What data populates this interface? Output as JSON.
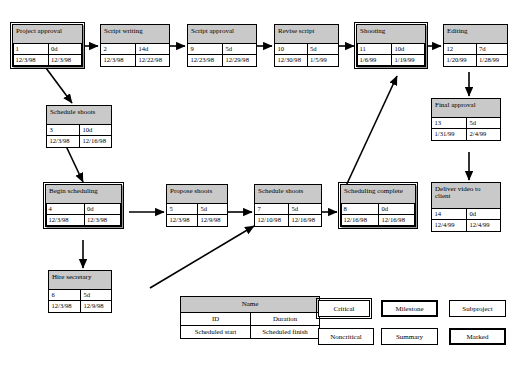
{
  "diagram": {
    "type": "project-network-diagram",
    "colors": {
      "node_header_fill": "#c9c9c9",
      "node_body_fill": "#ffffff",
      "border": "#000000",
      "page_background": "#ffffff"
    },
    "nodes": [
      {
        "key": "project_approval",
        "name": "Project approval",
        "id": "1",
        "duration": "0d",
        "start": "12/3/98",
        "finish": "12/3/98",
        "style": "milestone"
      },
      {
        "key": "script_writing",
        "name": "Script writing",
        "id": "2",
        "duration": "14d",
        "start": "12/3/98",
        "finish": "12/22/98",
        "style": "critical"
      },
      {
        "key": "script_approval",
        "name": "Script approval",
        "id": "9",
        "duration": "5d",
        "start": "12/23/98",
        "finish": "12/29/98",
        "style": "critical"
      },
      {
        "key": "revise_script",
        "name": "Revise script",
        "id": "10",
        "duration": "5d",
        "start": "12/30/98",
        "finish": "1/5/99",
        "style": "critical"
      },
      {
        "key": "shooting",
        "name": "Shooting",
        "id": "11",
        "duration": "10d",
        "start": "1/6/99",
        "finish": "1/19/99",
        "style": "marked"
      },
      {
        "key": "editing",
        "name": "Editing",
        "id": "12",
        "duration": "7d",
        "start": "1/20/99",
        "finish": "1/28/99",
        "style": "critical"
      },
      {
        "key": "final_approval",
        "name": "Final approval",
        "id": "13",
        "duration": "5d",
        "start": "1/31/99",
        "finish": "2/4/99",
        "style": "critical"
      },
      {
        "key": "deliver_video",
        "name": "Deliver video to client",
        "id": "14",
        "duration": "0d",
        "start": "12/4/99",
        "finish": "12/4/99",
        "style": "critical"
      },
      {
        "key": "schedule_shoots_3",
        "name": "Schedule shoots",
        "id": "3",
        "duration": "10d",
        "start": "12/3/98",
        "finish": "12/16/98",
        "style": "critical"
      },
      {
        "key": "begin_scheduling",
        "name": "Begin scheduling",
        "id": "4",
        "duration": "0d",
        "start": "12/3/98",
        "finish": "12/3/98",
        "style": "milestone"
      },
      {
        "key": "propose_shoots",
        "name": "Propose shoots",
        "id": "5",
        "duration": "5d",
        "start": "12/3/98",
        "finish": "12/9/98",
        "style": "critical"
      },
      {
        "key": "schedule_shoots_7",
        "name": "Schedule shoots",
        "id": "7",
        "duration": "5d",
        "start": "12/10/98",
        "finish": "12/16/98",
        "style": "critical"
      },
      {
        "key": "scheduling_complete",
        "name": "Scheduling complete",
        "id": "8",
        "duration": "0d",
        "start": "12/16/98",
        "finish": "12/16/98",
        "style": "milestone"
      },
      {
        "key": "hire_secretary",
        "name": "Hire secretary",
        "id": "6",
        "duration": "5d",
        "start": "12/3/98",
        "finish": "12/9/98",
        "style": "critical"
      }
    ],
    "edges": [
      {
        "from": "project_approval",
        "to": "script_writing"
      },
      {
        "from": "script_writing",
        "to": "script_approval"
      },
      {
        "from": "script_approval",
        "to": "revise_script"
      },
      {
        "from": "revise_script",
        "to": "shooting"
      },
      {
        "from": "shooting",
        "to": "editing"
      },
      {
        "from": "editing",
        "to": "final_approval"
      },
      {
        "from": "final_approval",
        "to": "deliver_video"
      },
      {
        "from": "project_approval",
        "to": "schedule_shoots_3"
      },
      {
        "from": "schedule_shoots_3",
        "to": "begin_scheduling"
      },
      {
        "from": "begin_scheduling",
        "to": "propose_shoots"
      },
      {
        "from": "propose_shoots",
        "to": "schedule_shoots_7"
      },
      {
        "from": "schedule_shoots_7",
        "to": "scheduling_complete"
      },
      {
        "from": "begin_scheduling",
        "to": "hire_secretary"
      },
      {
        "from": "hire_secretary",
        "to": "schedule_shoots_7"
      },
      {
        "from": "scheduling_complete",
        "to": "shooting"
      }
    ]
  },
  "legend": {
    "key_template": {
      "name_label": "Name",
      "id_label": "ID",
      "duration_label": "Duration",
      "start_label": "Scheduled start",
      "finish_label": "Scheduled finish"
    },
    "swatches": [
      {
        "key": "critical",
        "label": "Critical",
        "style": "double"
      },
      {
        "key": "milestone",
        "label": "Milestone",
        "style": "thick"
      },
      {
        "key": "subproject",
        "label": "Subproject",
        "style": "thin"
      },
      {
        "key": "noncritical",
        "label": "Noncritical",
        "style": "thin"
      },
      {
        "key": "summary",
        "label": "Summary",
        "style": "thin"
      },
      {
        "key": "marked",
        "label": "Marked",
        "style": "thick"
      }
    ]
  }
}
